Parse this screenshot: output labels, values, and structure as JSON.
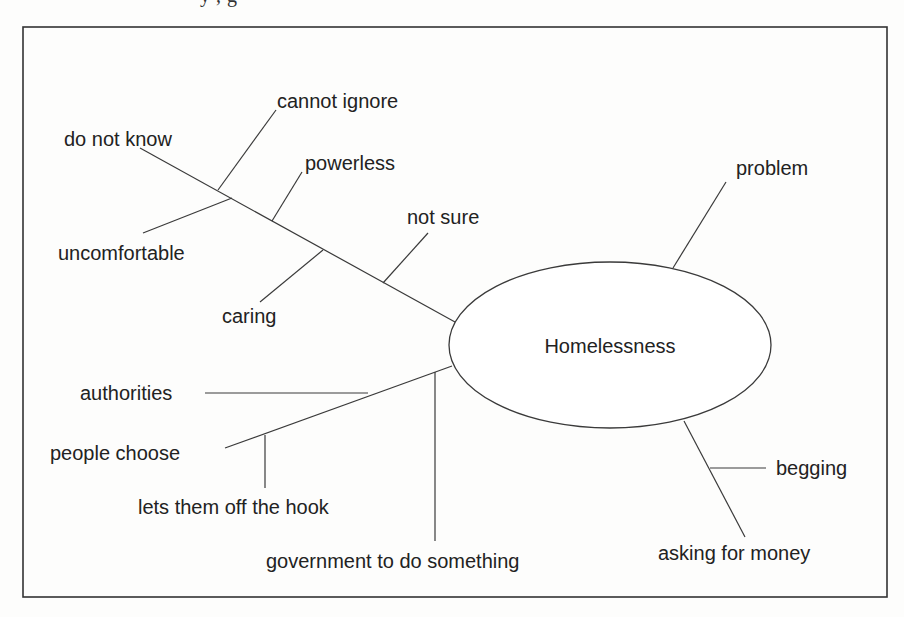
{
  "page": {
    "cutoff_header_text": "  y             ,         g"
  },
  "diagram": {
    "type": "concept-map",
    "central_node": {
      "label": "Homelessness",
      "shape": "ellipse",
      "cx": 610,
      "cy": 345,
      "rx": 161,
      "ry": 83
    },
    "labels": {
      "do_not_know": "do not know",
      "cannot_ignore": "cannot ignore",
      "uncomfortable": "uncomfortable",
      "powerless": "powerless",
      "caring": "caring",
      "not_sure": "not sure",
      "problem": "problem",
      "authorities": "authorities",
      "people_choose": "people choose",
      "lets_them_off_the_hook": "lets them off the hook",
      "government_to_do_something": "government to do something",
      "begging": "begging",
      "asking_for_money": "asking for money"
    },
    "branches": [
      {
        "from": "Homelessness",
        "to": "do not know",
        "children": [
          "cannot ignore",
          "uncomfortable",
          "powerless",
          "caring",
          "not sure"
        ]
      },
      {
        "from": "Homelessness",
        "to": "problem",
        "children": []
      },
      {
        "from": "Homelessness",
        "to": "people choose",
        "children": [
          "authorities",
          "lets them off the hook"
        ]
      },
      {
        "from": "Homelessness",
        "to": "government to do something",
        "children": []
      },
      {
        "from": "Homelessness",
        "to": "asking for money",
        "children": [
          "begging"
        ]
      }
    ],
    "colors": {
      "line": "#3a3a3a",
      "text": "#222222",
      "background": "#fdfdfc"
    }
  }
}
